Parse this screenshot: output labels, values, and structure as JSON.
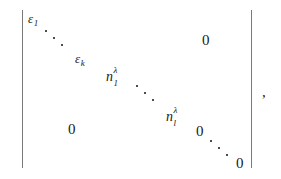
{
  "expression": {
    "type": "determinant",
    "notation": "vertical-bars",
    "trailing_punctuation": ",",
    "left_bar": "|",
    "right_bar": "|"
  },
  "diagonal_entries": [
    {
      "base": "ε",
      "sub": "1",
      "sup": "",
      "label": "epsilon-1"
    },
    {
      "base": "ε",
      "sub": "k",
      "sup": "",
      "label": "epsilon-k"
    },
    {
      "base": "n",
      "sub": "1",
      "sup": "λ",
      "label": "n-1-lambda"
    },
    {
      "base": "n",
      "sub": "l",
      "sup": "λ",
      "label": "n-l-lambda"
    }
  ],
  "diagonal_zeros": {
    "first": "0",
    "last": "0"
  },
  "offdiagonal_zeros": {
    "upper_right": "0",
    "lower_left": "0"
  },
  "ellipses": {
    "count": 4,
    "glyph": "⋱",
    "name": "diagonal-dots"
  },
  "entries": {
    "epsilon_1": "ε",
    "epsilon_1_sub": "1",
    "epsilon_k": "ε",
    "epsilon_k_sub": "k",
    "n_first": "n",
    "n_first_sub": "1",
    "n_first_sup": "λ",
    "n_last": "n",
    "n_last_sub": "l",
    "n_last_sup": "λ",
    "zero_upper_right": "0",
    "zero_lower_left": "0",
    "zero_diag_upper": "0",
    "zero_diag_lower": "0",
    "comma": ","
  },
  "colors": {
    "background": "#ffffff",
    "text": "#1a1a1a",
    "bar": "#7a7a7a",
    "dot": "#2a2a2a"
  }
}
